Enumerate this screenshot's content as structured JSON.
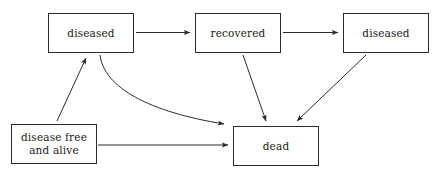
{
  "diagram": {
    "background_color": "#ffffff",
    "stroke_color": "#2b2b2b",
    "text_color": "#1a1a1a",
    "nodes": [
      {
        "id": "diseased-top-left",
        "label": "diseased",
        "x": 48,
        "y": 13,
        "w": 86,
        "h": 40
      },
      {
        "id": "recovered",
        "label": "recovered",
        "x": 195,
        "y": 13,
        "w": 86,
        "h": 40
      },
      {
        "id": "diseased-top-right",
        "label": "diseased",
        "x": 343,
        "y": 13,
        "w": 86,
        "h": 40
      },
      {
        "id": "disease-free-alive",
        "label": "disease free\nand alive",
        "x": 11,
        "y": 124,
        "w": 86,
        "h": 40
      },
      {
        "id": "dead",
        "label": "dead",
        "x": 233,
        "y": 126,
        "w": 86,
        "h": 40
      }
    ],
    "edges": [
      {
        "id": "diseased-to-recovered",
        "from": "diseased-top-left",
        "to": "recovered",
        "shape": "straight"
      },
      {
        "id": "recovered-to-diseased",
        "from": "recovered",
        "to": "diseased-top-right",
        "shape": "straight"
      },
      {
        "id": "disease-free-to-diseased",
        "from": "disease-free-alive",
        "to": "diseased-top-left",
        "shape": "straight"
      },
      {
        "id": "disease-free-to-dead",
        "from": "disease-free-alive",
        "to": "dead",
        "shape": "straight"
      },
      {
        "id": "diseased-to-dead",
        "from": "diseased-top-left",
        "to": "dead",
        "shape": "curved"
      },
      {
        "id": "recovered-to-dead",
        "from": "recovered",
        "to": "dead",
        "shape": "straight"
      },
      {
        "id": "diseased-right-to-dead",
        "from": "diseased-top-right",
        "to": "dead",
        "shape": "straight"
      }
    ]
  }
}
